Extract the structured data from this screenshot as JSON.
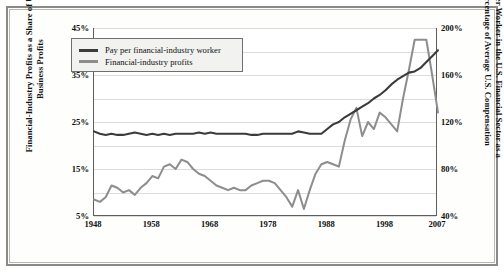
{
  "chart_data": {
    "type": "line",
    "title": "",
    "xlabel": "",
    "grid": true,
    "legend_position": "top-left",
    "x_ticks": [
      "1948",
      "1958",
      "1968",
      "1978",
      "1988",
      "1998",
      "2007"
    ],
    "xlim": [
      1948,
      2007
    ],
    "axes": {
      "left": {
        "label": "Financial-Industry Profits as a Share of U.S. Business Profits",
        "ticks": [
          "5%",
          "15%",
          "25%",
          "35%",
          "45%"
        ],
        "tick_values": [
          5,
          15,
          25,
          35,
          45
        ],
        "gridline_values": [
          5,
          10,
          15,
          20,
          25,
          30,
          35,
          40,
          45
        ],
        "ylim": [
          5,
          45
        ]
      },
      "right": {
        "label": "Pay per Worker in the U.S. Financial Sector as a Percentage of Average U.S. Compensation",
        "ticks": [
          "40%",
          "80%",
          "120%",
          "160%",
          "200%"
        ],
        "tick_values": [
          40,
          80,
          120,
          160,
          200
        ],
        "ylim": [
          40,
          200
        ]
      }
    },
    "series": [
      {
        "name": "Pay per financial-industry worker",
        "axis": "right",
        "color": "#3b3b3b",
        "x": [
          1948,
          1949,
          1950,
          1951,
          1952,
          1953,
          1954,
          1955,
          1956,
          1957,
          1958,
          1959,
          1960,
          1961,
          1962,
          1963,
          1964,
          1965,
          1966,
          1967,
          1968,
          1969,
          1970,
          1971,
          1972,
          1973,
          1974,
          1975,
          1976,
          1977,
          1978,
          1979,
          1980,
          1981,
          1982,
          1983,
          1984,
          1985,
          1986,
          1987,
          1988,
          1989,
          1990,
          1991,
          1992,
          1993,
          1994,
          1995,
          1996,
          1997,
          1998,
          1999,
          2000,
          2001,
          2002,
          2003,
          2004,
          2005,
          2006,
          2007
        ],
        "values": [
          112,
          110,
          109,
          110,
          109,
          109,
          110,
          111,
          110,
          109,
          110,
          109,
          110,
          109,
          110,
          110,
          110,
          110,
          111,
          110,
          111,
          110,
          110,
          110,
          110,
          110,
          110,
          109,
          109,
          110,
          110,
          110,
          110,
          110,
          110,
          112,
          111,
          110,
          110,
          110,
          114,
          118,
          120,
          124,
          127,
          130,
          133,
          136,
          140,
          143,
          147,
          152,
          156,
          159,
          162,
          163,
          166,
          171,
          176,
          181
        ]
      },
      {
        "name": "Financial-industry profits",
        "axis": "left",
        "color": "#8d8d8d",
        "x": [
          1948,
          1949,
          1950,
          1951,
          1952,
          1953,
          1954,
          1955,
          1956,
          1957,
          1958,
          1959,
          1960,
          1961,
          1962,
          1963,
          1964,
          1965,
          1966,
          1967,
          1968,
          1969,
          1970,
          1971,
          1972,
          1973,
          1974,
          1975,
          1976,
          1977,
          1978,
          1979,
          1980,
          1981,
          1982,
          1983,
          1984,
          1985,
          1986,
          1987,
          1988,
          1989,
          1990,
          1991,
          1992,
          1993,
          1994,
          1995,
          1996,
          1997,
          1998,
          1999,
          2000,
          2001,
          2002,
          2003,
          2004,
          2005,
          2006,
          2007
        ],
        "values": [
          8.5,
          8.0,
          9.0,
          11.5,
          11.0,
          10.0,
          10.5,
          9.5,
          11.0,
          12.0,
          13.5,
          13.0,
          15.5,
          16.0,
          15.0,
          17.0,
          16.5,
          15.0,
          14.0,
          13.5,
          12.5,
          11.5,
          11.0,
          10.5,
          11.0,
          10.5,
          10.5,
          11.5,
          12.0,
          12.5,
          12.5,
          12.0,
          10.5,
          9.0,
          7.0,
          10.5,
          6.5,
          10.5,
          14.0,
          16.0,
          16.5,
          16.0,
          15.5,
          21.0,
          25.5,
          28.0,
          22.0,
          25.0,
          23.5,
          27.0,
          26.0,
          24.5,
          23.0,
          30.0,
          36.0,
          42.5,
          42.5,
          42.5,
          35.0,
          27.0
        ]
      }
    ]
  },
  "legend": {
    "items": [
      {
        "label": "Pay per financial-industry worker",
        "swatch": "line-swatch-dark"
      },
      {
        "label": "Financial-industry profits",
        "swatch": "line-swatch-gray"
      }
    ]
  },
  "colors": {
    "pay_line": "#3b3b3b",
    "profits_line": "#8d8d8d",
    "gridline": "#dcdcdc",
    "frame": "#8a8a86",
    "axis": "#5d5d5d"
  }
}
